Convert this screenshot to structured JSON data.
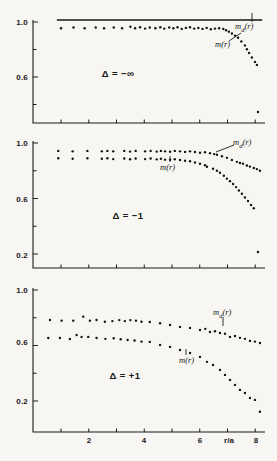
{
  "chart_data": [
    {
      "type": "scatter",
      "panel": "top",
      "annotation": "Δ = −∞",
      "xlim": [
        0,
        8.4
      ],
      "ylim": [
        0.265,
        1.0
      ],
      "grid": false,
      "x_axis": {
        "ticks": [
          1,
          2,
          3,
          4,
          5,
          6,
          7,
          8
        ],
        "labels": []
      },
      "y_axis": {
        "ticks": [
          1.0,
          0.8,
          0.6,
          0.4
        ],
        "labels": [
          {
            "value": 1.0,
            "text": "1.0"
          },
          {
            "value": 0.6,
            "text": "0.6"
          }
        ]
      },
      "series": [
        {
          "name": "m_d(r)",
          "display": {
            "main": "m",
            "sub": "d",
            "tail": "(r)"
          },
          "mark": "line",
          "x_start": 0.85,
          "x_end": 8.25,
          "value": 1.0
        },
        {
          "name": "m(r)",
          "display_text": "m(r)",
          "mark": "points",
          "points": [
            [
              1.0,
              0.955
            ],
            [
              1.45,
              0.96
            ],
            [
              1.85,
              0.955
            ],
            [
              2.25,
              0.96
            ],
            [
              2.55,
              0.955
            ],
            [
              2.9,
              0.96
            ],
            [
              3.2,
              0.955
            ],
            [
              3.5,
              0.965
            ],
            [
              3.67,
              0.955
            ],
            [
              3.85,
              0.962
            ],
            [
              4.03,
              0.952
            ],
            [
              4.2,
              0.96
            ],
            [
              4.4,
              0.955
            ],
            [
              4.58,
              0.962
            ],
            [
              4.72,
              0.952
            ],
            [
              4.9,
              0.96
            ],
            [
              5.05,
              0.955
            ],
            [
              5.2,
              0.962
            ],
            [
              5.35,
              0.95
            ],
            [
              5.5,
              0.957
            ],
            [
              5.65,
              0.962
            ],
            [
              5.8,
              0.952
            ],
            [
              5.95,
              0.957
            ],
            [
              6.1,
              0.95
            ],
            [
              6.25,
              0.957
            ],
            [
              6.4,
              0.947
            ],
            [
              6.55,
              0.952
            ],
            [
              6.7,
              0.955
            ],
            [
              6.85,
              0.949
            ],
            [
              6.95,
              0.94
            ],
            [
              7.05,
              0.93
            ],
            [
              7.16,
              0.916
            ],
            [
              7.27,
              0.901
            ],
            [
              7.38,
              0.886
            ],
            [
              7.5,
              0.858
            ],
            [
              7.63,
              0.83
            ],
            [
              7.7,
              0.802
            ],
            [
              7.78,
              0.775
            ],
            [
              7.88,
              0.742
            ],
            [
              7.99,
              0.71
            ],
            [
              8.06,
              0.688
            ]
          ]
        },
        {
          "name": "m(r) outlier",
          "mark": "points",
          "points": [
            [
              8.1,
              0.345
            ]
          ]
        }
      ]
    },
    {
      "type": "scatter",
      "panel": "middle",
      "annotation": "Δ = −1",
      "xlim": [
        0,
        8.4
      ],
      "ylim": [
        0.09,
        1.0
      ],
      "grid": false,
      "x_axis": {
        "ticks": [
          1,
          2,
          3,
          4,
          5,
          6,
          7,
          8
        ],
        "labels": []
      },
      "y_axis": {
        "ticks": [
          1.0,
          0.8,
          0.6,
          0.4,
          0.2
        ],
        "labels": [
          {
            "value": 1.0,
            "text": "1.0"
          },
          {
            "value": 0.6,
            "text": "0.6"
          },
          {
            "value": 0.2,
            "text": "0.2"
          }
        ]
      },
      "series": [
        {
          "name": "m_d(r)",
          "display": {
            "main": "m",
            "sub": "d",
            "tail": "(r)"
          },
          "mark": "points",
          "points": [
            [
              0.9,
              0.943
            ],
            [
              1.42,
              0.94
            ],
            [
              1.95,
              0.943
            ],
            [
              2.47,
              0.94
            ],
            [
              2.67,
              0.943
            ],
            [
              2.88,
              0.94
            ],
            [
              3.28,
              0.943
            ],
            [
              3.49,
              0.938
            ],
            [
              3.69,
              0.943
            ],
            [
              4.03,
              0.94
            ],
            [
              4.23,
              0.943
            ],
            [
              4.45,
              0.938
            ],
            [
              4.6,
              0.943
            ],
            [
              4.75,
              0.94
            ],
            [
              4.93,
              0.937
            ],
            [
              5.1,
              0.943
            ],
            [
              5.29,
              0.94
            ],
            [
              5.47,
              0.936
            ],
            [
              5.65,
              0.94
            ],
            [
              5.83,
              0.935
            ],
            [
              6.01,
              0.93
            ],
            [
              6.19,
              0.933
            ],
            [
              6.37,
              0.927
            ],
            [
              6.52,
              0.92
            ],
            [
              6.62,
              0.915
            ],
            [
              6.8,
              0.905
            ],
            [
              6.98,
              0.893
            ],
            [
              7.16,
              0.877
            ],
            [
              7.34,
              0.864
            ],
            [
              7.45,
              0.856
            ],
            [
              7.56,
              0.85
            ],
            [
              7.7,
              0.838
            ],
            [
              7.81,
              0.83
            ],
            [
              7.95,
              0.82
            ],
            [
              8.06,
              0.812
            ],
            [
              8.17,
              0.8
            ]
          ]
        },
        {
          "name": "m(r)",
          "display_text": "m(r)",
          "mark": "points",
          "points": [
            [
              0.9,
              0.89
            ],
            [
              1.42,
              0.886
            ],
            [
              1.95,
              0.89
            ],
            [
              2.47,
              0.886
            ],
            [
              2.67,
              0.89
            ],
            [
              2.88,
              0.884
            ],
            [
              3.28,
              0.888
            ],
            [
              3.49,
              0.883
            ],
            [
              3.69,
              0.888
            ],
            [
              4.03,
              0.884
            ],
            [
              4.23,
              0.888
            ],
            [
              4.45,
              0.882
            ],
            [
              4.6,
              0.886
            ],
            [
              4.75,
              0.88
            ],
            [
              4.93,
              0.879
            ],
            [
              5.1,
              0.883
            ],
            [
              5.29,
              0.878
            ],
            [
              5.47,
              0.872
            ],
            [
              5.65,
              0.868
            ],
            [
              5.83,
              0.86
            ],
            [
              6.01,
              0.85
            ],
            [
              6.19,
              0.84
            ],
            [
              6.26,
              0.829
            ],
            [
              6.48,
              0.814
            ],
            [
              6.62,
              0.8
            ],
            [
              6.73,
              0.786
            ],
            [
              6.87,
              0.764
            ],
            [
              6.98,
              0.743
            ],
            [
              7.09,
              0.725
            ],
            [
              7.2,
              0.705
            ],
            [
              7.31,
              0.682
            ],
            [
              7.41,
              0.658
            ],
            [
              7.52,
              0.634
            ],
            [
              7.63,
              0.607
            ],
            [
              7.74,
              0.582
            ],
            [
              7.85,
              0.553
            ],
            [
              7.95,
              0.53
            ]
          ]
        },
        {
          "name": "m(r) outlier",
          "mark": "points",
          "points": [
            [
              8.1,
              0.214
            ]
          ]
        }
      ]
    },
    {
      "type": "scatter",
      "panel": "bottom",
      "annotation": "Δ = +1",
      "xlabel": "r/a",
      "xlim": [
        0,
        8.4
      ],
      "ylim": [
        0.0,
        1.0
      ],
      "grid": false,
      "x_axis": {
        "ticks": [
          1,
          2,
          3,
          4,
          5,
          6,
          7,
          8
        ],
        "labels": [
          {
            "value": 2,
            "text": "2"
          },
          {
            "value": 4,
            "text": "4"
          },
          {
            "value": 6,
            "text": "6"
          },
          {
            "value": 8,
            "text": "8"
          }
        ],
        "title": "r/a"
      },
      "y_axis": {
        "ticks": [
          1.0,
          0.8,
          0.6,
          0.4,
          0.2
        ],
        "labels": [
          {
            "value": 1.0,
            "text": "1.0"
          },
          {
            "value": 0.6,
            "text": "0.6"
          },
          {
            "value": 0.2,
            "text": "0.2"
          }
        ]
      },
      "series": [
        {
          "name": "m_d(r)",
          "display": {
            "main": "m",
            "sub": "d",
            "tail": "(r)"
          },
          "mark": "points",
          "points": [
            [
              0.6,
              0.784
            ],
            [
              1.02,
              0.779
            ],
            [
              1.44,
              0.779
            ],
            [
              1.8,
              0.808
            ],
            [
              2.04,
              0.779
            ],
            [
              2.28,
              0.784
            ],
            [
              2.58,
              0.771
            ],
            [
              2.85,
              0.776
            ],
            [
              3.1,
              0.783
            ],
            [
              3.3,
              0.776
            ],
            [
              3.5,
              0.783
            ],
            [
              3.7,
              0.779
            ],
            [
              3.9,
              0.771
            ],
            [
              4.2,
              0.769
            ],
            [
              4.57,
              0.76
            ],
            [
              4.93,
              0.748
            ],
            [
              5.29,
              0.734
            ],
            [
              5.65,
              0.727
            ],
            [
              6.01,
              0.712
            ],
            [
              6.2,
              0.72
            ],
            [
              6.37,
              0.698
            ],
            [
              6.55,
              0.703
            ],
            [
              6.73,
              0.69
            ],
            [
              6.91,
              0.685
            ],
            [
              7.09,
              0.662
            ],
            [
              7.27,
              0.668
            ],
            [
              7.45,
              0.655
            ],
            [
              7.63,
              0.648
            ],
            [
              7.81,
              0.633
            ],
            [
              7.99,
              0.628
            ],
            [
              8.17,
              0.618
            ]
          ]
        },
        {
          "name": "m(r)",
          "display_text": "m(r)",
          "mark": "points",
          "points": [
            [
              0.54,
              0.654
            ],
            [
              0.96,
              0.654
            ],
            [
              1.32,
              0.647
            ],
            [
              1.56,
              0.676
            ],
            [
              1.74,
              0.662
            ],
            [
              1.98,
              0.662
            ],
            [
              2.28,
              0.654
            ],
            [
              2.6,
              0.648
            ],
            [
              2.9,
              0.652
            ],
            [
              3.15,
              0.645
            ],
            [
              3.4,
              0.64
            ],
            [
              3.65,
              0.636
            ],
            [
              3.9,
              0.628
            ],
            [
              4.2,
              0.626
            ],
            [
              4.57,
              0.604
            ],
            [
              4.93,
              0.59
            ],
            [
              5.29,
              0.568
            ],
            [
              5.65,
              0.546
            ],
            [
              6.01,
              0.518
            ],
            [
              6.26,
              0.482
            ],
            [
              6.48,
              0.46
            ],
            [
              6.73,
              0.424
            ],
            [
              6.91,
              0.388
            ],
            [
              7.09,
              0.352
            ],
            [
              7.27,
              0.316
            ],
            [
              7.45,
              0.28
            ],
            [
              7.63,
              0.258
            ],
            [
              7.81,
              0.222
            ],
            [
              7.99,
              0.208
            ]
          ]
        },
        {
          "name": "m(r) outlier",
          "mark": "points",
          "points": [
            [
              8.17,
              0.122
            ]
          ]
        }
      ]
    }
  ]
}
